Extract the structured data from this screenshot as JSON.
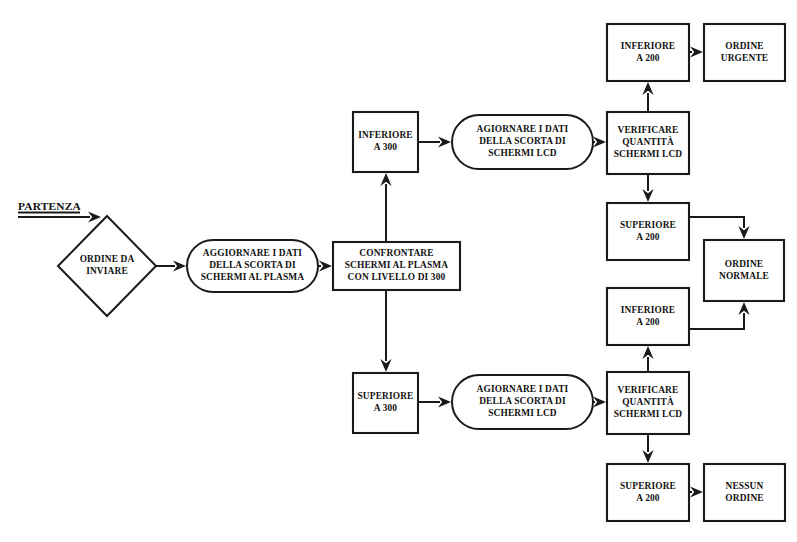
{
  "diagram": {
    "background_color": "#ffffff",
    "line_color": "#1a1a1a",
    "text_color": "#111111",
    "start_label": "PARTENZA",
    "nodes": [
      {
        "id": "ordine-da-inviare",
        "shape": "diamond",
        "lines": [
          "ORDINE DA",
          "INVIARE"
        ],
        "x": 58,
        "y": 216,
        "w": 98,
        "h": 100
      },
      {
        "id": "aggiornare-plasma",
        "shape": "oval",
        "lines": [
          "AGGIORNARE I DATI",
          "DELLA SCORTA DI",
          "SCHERMI AL PLASMA"
        ],
        "x": 187,
        "y": 240,
        "w": 131,
        "h": 52
      },
      {
        "id": "confrontare-plasma",
        "shape": "rect",
        "lines": [
          "CONFRONTARE",
          "SCHERMI AL PLASMA",
          "CON LIVELLO DI 300"
        ],
        "x": 333,
        "y": 242,
        "w": 127,
        "h": 48
      },
      {
        "id": "inferiore-300",
        "shape": "rect",
        "lines": [
          "INFERIORE",
          "A 300"
        ],
        "x": 353,
        "y": 112,
        "w": 65,
        "h": 60
      },
      {
        "id": "superiore-300",
        "shape": "rect",
        "lines": [
          "SUPERIORE",
          "A 300"
        ],
        "x": 353,
        "y": 373,
        "w": 65,
        "h": 60
      },
      {
        "id": "agiornare-lcd-top",
        "shape": "oval",
        "lines": [
          "AGIORNARE I DATI",
          "DELLA SCORTA DI",
          "SCHERMI LCD"
        ],
        "x": 452,
        "y": 115,
        "w": 141,
        "h": 54
      },
      {
        "id": "agiornare-lcd-bottom",
        "shape": "oval",
        "lines": [
          "AGIORNARE I DATI",
          "DELLA SCORTA DI",
          "SCHERMI LCD"
        ],
        "x": 452,
        "y": 375,
        "w": 141,
        "h": 54
      },
      {
        "id": "verificare-lcd-top",
        "shape": "rect",
        "lines": [
          "VERIFICARE",
          "QUANTITÀ",
          "SCHERMI LCD"
        ],
        "x": 607,
        "y": 112,
        "w": 82,
        "h": 62
      },
      {
        "id": "verificare-lcd-bottom",
        "shape": "rect",
        "lines": [
          "VERIFICARE",
          "QUANTITÀ",
          "SCHERMI LCD"
        ],
        "x": 607,
        "y": 372,
        "w": 82,
        "h": 62
      },
      {
        "id": "inferiore-200-top",
        "shape": "rect",
        "lines": [
          "INFERIORE",
          "A 200"
        ],
        "x": 607,
        "y": 24,
        "w": 82,
        "h": 57
      },
      {
        "id": "ordine-urgente",
        "shape": "rect",
        "lines": [
          "ORDINE",
          "URGENTE"
        ],
        "x": 704,
        "y": 24,
        "w": 81,
        "h": 57
      },
      {
        "id": "superiore-200-top",
        "shape": "rect",
        "lines": [
          "SUPERIORE",
          "A 200"
        ],
        "x": 607,
        "y": 203,
        "w": 82,
        "h": 57
      },
      {
        "id": "inferiore-200-bottom",
        "shape": "rect",
        "lines": [
          "INFERIORE",
          "A 200"
        ],
        "x": 607,
        "y": 288,
        "w": 82,
        "h": 57
      },
      {
        "id": "ordine-normale",
        "shape": "rect",
        "lines": [
          "ORDINE",
          "NORMALE"
        ],
        "x": 704,
        "y": 240,
        "w": 80,
        "h": 61
      },
      {
        "id": "superiore-200-bottom",
        "shape": "rect",
        "lines": [
          "SUPERIORE",
          "A 200"
        ],
        "x": 607,
        "y": 464,
        "w": 82,
        "h": 57
      },
      {
        "id": "nessun-ordine",
        "shape": "rect",
        "lines": [
          "NESSUN",
          "ORDINE"
        ],
        "x": 704,
        "y": 464,
        "w": 81,
        "h": 57
      }
    ],
    "edges": [
      {
        "id": "start-to-diamond",
        "from": "start",
        "to": "ordine-da-inviare",
        "points": [
          [
            18,
            217
          ],
          [
            101,
            217
          ]
        ],
        "head": "right"
      },
      {
        "id": "diamond-to-aggiornare",
        "from": "ordine-da-inviare",
        "to": "aggiornare-plasma",
        "points": [
          [
            156,
            266
          ],
          [
            186,
            266
          ]
        ],
        "head": "right"
      },
      {
        "id": "aggiornare-to-confrontare",
        "from": "aggiornare-plasma",
        "to": "confrontare-plasma",
        "points": [
          [
            318,
            266
          ],
          [
            332,
            266
          ]
        ],
        "head": "right"
      },
      {
        "id": "confrontare-to-inferiore300",
        "from": "confrontare-plasma",
        "to": "inferiore-300",
        "points": [
          [
            386,
            242
          ],
          [
            386,
            173
          ]
        ],
        "head": "up"
      },
      {
        "id": "confrontare-to-superiore300",
        "from": "confrontare-plasma",
        "to": "superiore-300",
        "points": [
          [
            386,
            290
          ],
          [
            386,
            372
          ]
        ],
        "head": "down"
      },
      {
        "id": "inferiore300-to-lcd-top",
        "from": "inferiore-300",
        "to": "agiornare-lcd-top",
        "points": [
          [
            418,
            142
          ],
          [
            451,
            142
          ]
        ],
        "head": "right"
      },
      {
        "id": "lcd-top-to-verificare-top",
        "from": "agiornare-lcd-top",
        "to": "verificare-lcd-top",
        "points": [
          [
            593,
            142
          ],
          [
            606,
            142
          ]
        ],
        "head": "right"
      },
      {
        "id": "verificare-top-to-inferiore200",
        "from": "verificare-lcd-top",
        "to": "inferiore-200-top",
        "points": [
          [
            648,
            112
          ],
          [
            648,
            82
          ]
        ],
        "head": "up"
      },
      {
        "id": "inferiore200-to-urgente",
        "from": "inferiore-200-top",
        "to": "ordine-urgente",
        "points": [
          [
            689,
            52
          ],
          [
            703,
            52
          ]
        ],
        "head": "right"
      },
      {
        "id": "verificare-top-to-superiore200",
        "from": "verificare-lcd-top",
        "to": "superiore-200-top",
        "points": [
          [
            648,
            174
          ],
          [
            648,
            202
          ]
        ],
        "head": "down"
      },
      {
        "id": "superiore200-to-normale",
        "from": "superiore-200-top",
        "to": "ordine-normale",
        "points": [
          [
            689,
            217
          ],
          [
            744,
            217
          ],
          [
            744,
            239
          ]
        ],
        "head": "down"
      },
      {
        "id": "inferiore200b-to-normale",
        "from": "inferiore-200-bottom",
        "to": "ordine-normale",
        "points": [
          [
            689,
            329
          ],
          [
            744,
            329
          ],
          [
            744,
            302
          ]
        ],
        "head": "up"
      },
      {
        "id": "verificare-bottom-to-inferiore200b",
        "from": "verificare-lcd-bottom",
        "to": "inferiore-200-bottom",
        "points": [
          [
            648,
            372
          ],
          [
            648,
            346
          ]
        ],
        "head": "up"
      },
      {
        "id": "verificare-bottom-to-superiore200b",
        "from": "verificare-lcd-bottom",
        "to": "superiore-200-bottom",
        "points": [
          [
            648,
            434
          ],
          [
            648,
            463
          ]
        ],
        "head": "down"
      },
      {
        "id": "superiore200b-to-nessun",
        "from": "superiore-200-bottom",
        "to": "nessun-ordine",
        "points": [
          [
            689,
            492
          ],
          [
            703,
            492
          ]
        ],
        "head": "right"
      },
      {
        "id": "superiore300-to-lcd-bottom",
        "from": "superiore-300",
        "to": "agiornare-lcd-bottom",
        "points": [
          [
            418,
            402
          ],
          [
            451,
            402
          ]
        ],
        "head": "right"
      },
      {
        "id": "lcd-bottom-to-verificare-bottom",
        "from": "agiornare-lcd-bottom",
        "to": "verificare-lcd-bottom",
        "points": [
          [
            593,
            402
          ],
          [
            606,
            402
          ]
        ],
        "head": "right"
      }
    ],
    "start_marker": {
      "x": 18,
      "y": 205,
      "label_x": 18,
      "label_y": 210
    }
  }
}
